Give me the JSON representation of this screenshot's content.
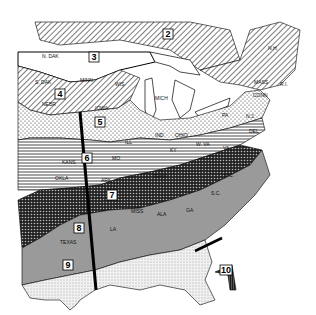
{
  "map": {
    "type": "hardiness-zone-map",
    "region": "Eastern United States",
    "zones": [
      {
        "number": "2",
        "pattern": "diagonal-hatch"
      },
      {
        "number": "3",
        "pattern": "blank"
      },
      {
        "number": "4",
        "pattern": "diagonal-hatch"
      },
      {
        "number": "5",
        "pattern": "dots"
      },
      {
        "number": "6",
        "pattern": "horizontal-lines"
      },
      {
        "number": "7",
        "pattern": "crosshatch-dark"
      },
      {
        "number": "8",
        "pattern": "gray"
      },
      {
        "number": "9",
        "pattern": "fine-stipple"
      },
      {
        "number": "10",
        "pattern": "dark-vertical"
      }
    ],
    "state_labels": [
      "N. DAK",
      "S. DAK",
      "MINN",
      "WIS",
      "NEBR",
      "IOWA",
      "MICH",
      "ILL",
      "IND",
      "OHIO",
      "PA",
      "N.Y.",
      "KANS",
      "MO",
      "KY",
      "W. VA",
      "VA",
      "DEL",
      "N.J.",
      "CONN",
      "MASS",
      "R.I.",
      "N.H.",
      "OKLA",
      "ARK",
      "TENN",
      "N.C.",
      "S.C.",
      "MISS",
      "ALA",
      "GA",
      "LA",
      "TEXAS"
    ]
  }
}
